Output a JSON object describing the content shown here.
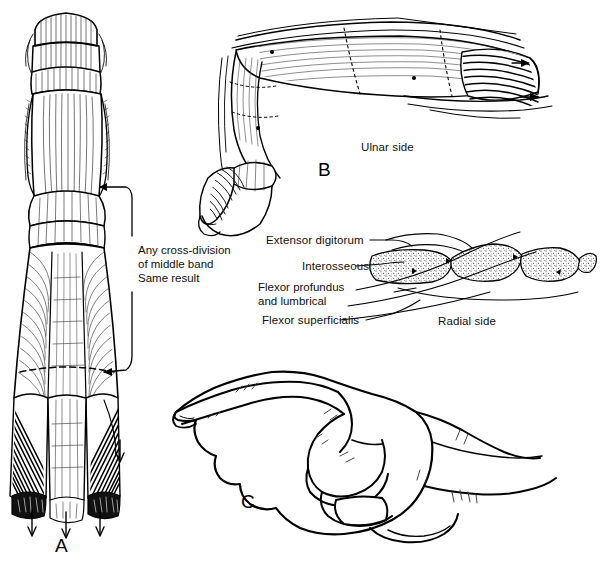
{
  "figure": {
    "background_color": "#ffffff",
    "ink_color": "#000000",
    "width": 604,
    "height": 565
  },
  "panels": [
    {
      "id": "A",
      "letter": "A",
      "name": "dorsal-extensor-mechanism-view",
      "description": "Dorsal view of finger extensor mechanism with central and lateral bands"
    },
    {
      "id": "B",
      "letter": "B",
      "name": "ulnar-lateral-flexed-finger-view",
      "description": "Lateral ulnar view of flexed finger showing extensor expansion"
    },
    {
      "id": "C",
      "letter": "C",
      "name": "pointing-hand-outline",
      "description": "Outline drawing of hand with index finger extended"
    }
  ],
  "annotations": {
    "cross_division_caption": "Any cross-division\nof middle band\nSame result",
    "ulnar_side": "Ulnar side",
    "radial_side": "Radial side"
  },
  "leader_labels": [
    {
      "key": "extensor-digitorum",
      "text": "Extensor digitorum"
    },
    {
      "key": "interosseous",
      "text": "Interosseous"
    },
    {
      "key": "flexor-profundus-lumbrical",
      "text": "Flexor profundus\nand lumbrical"
    },
    {
      "key": "flexor-superficialis",
      "text": "Flexor superficialis"
    }
  ]
}
